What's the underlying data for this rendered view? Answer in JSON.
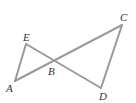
{
  "diagram": {
    "type": "geometry",
    "points": {
      "A": {
        "label": "A",
        "x": 15,
        "y": 81,
        "lx": 6,
        "ly": 92
      },
      "B": {
        "label": "B",
        "x": 54,
        "y": 61,
        "lx": 48,
        "ly": 75
      },
      "C": {
        "label": "C",
        "x": 122,
        "y": 25,
        "lx": 120,
        "ly": 21
      },
      "D": {
        "label": "D",
        "x": 101,
        "y": 88,
        "lx": 99,
        "ly": 100
      },
      "E": {
        "label": "E",
        "x": 26,
        "y": 44,
        "lx": 23,
        "ly": 41
      }
    },
    "segments": [
      [
        "A",
        "C"
      ],
      [
        "E",
        "D"
      ],
      [
        "A",
        "E"
      ],
      [
        "C",
        "D"
      ]
    ],
    "stroke_color": "#9a9a9a"
  }
}
